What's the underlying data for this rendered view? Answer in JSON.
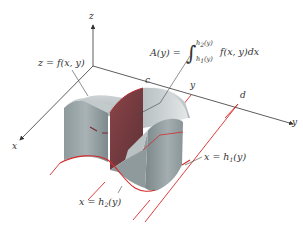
{
  "diagram": {
    "type": "3D solid volume by cross-sections",
    "axes": {
      "z_label": "z",
      "x_label": "x",
      "y_label": "y"
    },
    "surface_label": "z = f(x, y)",
    "area_formula": {
      "lhs": "A(y) =",
      "upper_limit_fn": "h",
      "upper_limit_sub": "2",
      "upper_limit_arg": "(y)",
      "lower_limit_fn": "h",
      "lower_limit_sub": "1",
      "lower_limit_arg": "(y)",
      "integrand": "f(x, y)dx"
    },
    "y_axis_marks": {
      "c": "c",
      "y": "y",
      "d": "d"
    },
    "boundary_labels": {
      "h1": {
        "lhs": "x = h",
        "sub": "1",
        "arg": "(y)"
      },
      "h2": {
        "lhs": "x = h",
        "sub": "2",
        "arg": "(y)"
      }
    },
    "colors": {
      "axis": "#333333",
      "boundary": "#d42a2a",
      "solid_light": "#c9cfd0",
      "solid_mid": "#9aa6a8",
      "solid_dark": "#6f7c7f",
      "cross_section": "#7a3a3e",
      "leader": "#444444"
    }
  }
}
